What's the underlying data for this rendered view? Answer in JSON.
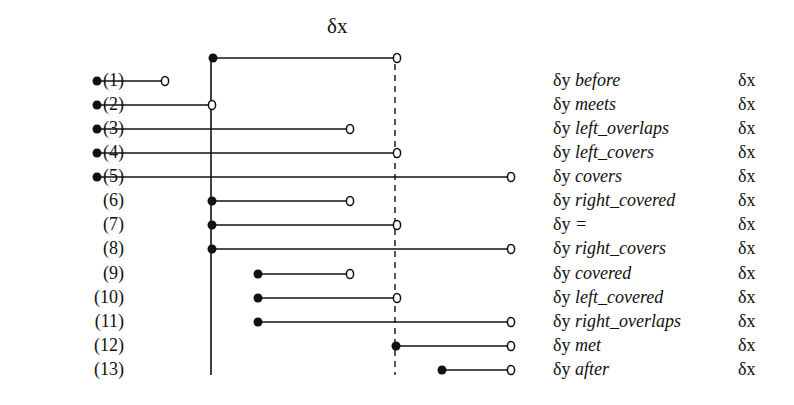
{
  "title": "δx",
  "reference": {
    "label": "δx",
    "start": 213,
    "end": 397,
    "y": 58
  },
  "guides": {
    "solid_x": 211,
    "dashed_x": 395,
    "top": 58,
    "bottom": 375
  },
  "rows": [
    {
      "num": "(1)",
      "left": "δy",
      "op": "before",
      "right": "δx",
      "y": 81,
      "start": 97,
      "end": 165
    },
    {
      "num": "(2)",
      "left": "δy",
      "op": "meets",
      "right": "δx",
      "y": 105,
      "start": 97,
      "end": 212
    },
    {
      "num": "(3)",
      "left": "δy",
      "op": "left_overlaps",
      "right": "δx",
      "y": 129,
      "start": 97,
      "end": 350
    },
    {
      "num": "(4)",
      "left": "δy",
      "op": "left_covers",
      "right": "δx",
      "y": 153,
      "start": 97,
      "end": 397
    },
    {
      "num": "(5)",
      "left": "δy",
      "op": "covers",
      "right": "δx",
      "y": 177,
      "start": 97,
      "end": 511
    },
    {
      "num": "(6)",
      "left": "δy",
      "op": "right_covered",
      "right": "δx",
      "y": 201,
      "start": 212,
      "end": 350
    },
    {
      "num": "(7)",
      "left": "δy",
      "op": "=",
      "right": "δx",
      "y": 225,
      "start": 212,
      "end": 397
    },
    {
      "num": "(8)",
      "left": "δy",
      "op": "right_covers",
      "right": "δx",
      "y": 249,
      "start": 212,
      "end": 511
    },
    {
      "num": "(9)",
      "left": "δy",
      "op": "covered",
      "right": "δx",
      "y": 274,
      "start": 258,
      "end": 350
    },
    {
      "num": "(10)",
      "left": "δy",
      "op": "left_covered",
      "right": "δx",
      "y": 298,
      "start": 258,
      "end": 397
    },
    {
      "num": "(11)",
      "left": "δy",
      "op": "right_overlaps",
      "right": "δx",
      "y": 322,
      "start": 258,
      "end": 511
    },
    {
      "num": "(12)",
      "left": "δy",
      "op": "met",
      "right": "δx",
      "y": 346,
      "start": 396,
      "end": 511
    },
    {
      "num": "(13)",
      "left": "δy",
      "op": "after",
      "right": "δx",
      "y": 370,
      "start": 442,
      "end": 511
    }
  ],
  "colors": {
    "ink": "#111111",
    "background": "#ffffff"
  }
}
